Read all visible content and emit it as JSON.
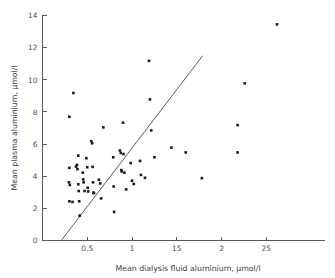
{
  "chart_data": {
    "type": "scatter",
    "title": "",
    "xlabel": "Mean dialysis fluid aluminium, µmol/l",
    "ylabel": "Mean plasma aluminium, µmol/l",
    "xlim": [
      0,
      3.0
    ],
    "ylim": [
      0,
      14
    ],
    "xticks": [
      0.5,
      1,
      1.5,
      2,
      2.5
    ],
    "xtick_labels": [
      "0.5",
      "1",
      "15",
      "2",
      "25"
    ],
    "yticks": [
      0,
      2,
      4,
      6,
      8,
      10,
      12,
      14
    ],
    "ytick_labels": [
      "0",
      "2",
      "4",
      "6",
      "8",
      "10",
      "12",
      "14"
    ],
    "grid": false,
    "legend": null,
    "marker": "filled-square",
    "marker_color": "#1a1a1a",
    "reference_line": {
      "label": "line of equality",
      "x_start": 0.21,
      "y_start": 0.0,
      "x_end": 1.79,
      "y_end": 11.5,
      "color": "#4a4a4c"
    },
    "points": [
      [
        0.3,
        7.7
      ],
      [
        0.345,
        9.18
      ],
      [
        0.3,
        4.52
      ],
      [
        0.295,
        3.62
      ],
      [
        0.305,
        3.46
      ],
      [
        0.3,
        2.44
      ],
      [
        0.335,
        2.4
      ],
      [
        0.375,
        4.6
      ],
      [
        0.385,
        4.7
      ],
      [
        0.39,
        4.44
      ],
      [
        0.4,
        5.28
      ],
      [
        0.4,
        3.5
      ],
      [
        0.405,
        3.08
      ],
      [
        0.41,
        2.44
      ],
      [
        0.415,
        1.55
      ],
      [
        0.45,
        4.22
      ],
      [
        0.455,
        3.8
      ],
      [
        0.46,
        3.62
      ],
      [
        0.47,
        3.08
      ],
      [
        0.49,
        5.12
      ],
      [
        0.5,
        4.56
      ],
      [
        0.505,
        3.28
      ],
      [
        0.51,
        3.05
      ],
      [
        0.545,
        6.18
      ],
      [
        0.555,
        6.05
      ],
      [
        0.56,
        4.58
      ],
      [
        0.565,
        3.62
      ],
      [
        0.57,
        2.98
      ],
      [
        0.575,
        2.95
      ],
      [
        0.63,
        3.78
      ],
      [
        0.645,
        3.55
      ],
      [
        0.655,
        2.62
      ],
      [
        0.68,
        7.04
      ],
      [
        0.79,
        5.18
      ],
      [
        0.795,
        3.36
      ],
      [
        0.8,
        1.78
      ],
      [
        0.865,
        5.6
      ],
      [
        0.875,
        5.45
      ],
      [
        0.88,
        4.38
      ],
      [
        0.885,
        4.3
      ],
      [
        0.9,
        7.33
      ],
      [
        0.905,
        5.38
      ],
      [
        0.915,
        4.22
      ],
      [
        0.935,
        3.18
      ],
      [
        0.985,
        4.82
      ],
      [
        1.0,
        3.72
      ],
      [
        1.02,
        3.52
      ],
      [
        1.09,
        4.95
      ],
      [
        1.1,
        4.08
      ],
      [
        1.145,
        3.9
      ],
      [
        1.19,
        11.18
      ],
      [
        1.2,
        8.78
      ],
      [
        1.215,
        6.85
      ],
      [
        1.25,
        5.18
      ],
      [
        1.44,
        5.78
      ],
      [
        1.6,
        5.48
      ],
      [
        1.78,
        3.88
      ],
      [
        2.18,
        7.18
      ],
      [
        2.18,
        5.48
      ],
      [
        2.26,
        9.78
      ],
      [
        2.62,
        13.45
      ]
    ]
  },
  "figure": {
    "background_color": "#ffffff",
    "axis_color": "#58585a"
  }
}
